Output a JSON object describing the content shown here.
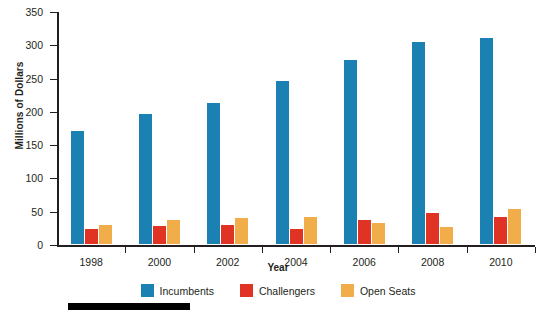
{
  "chart_data": {
    "type": "bar",
    "title": "",
    "xlabel": "Year",
    "ylabel": "Millions of Dollars",
    "categories": [
      "1998",
      "2000",
      "2002",
      "2004",
      "2006",
      "2008",
      "2010"
    ],
    "series": [
      {
        "name": "Incumbents",
        "color": "#1b81b3",
        "values": [
          170,
          195,
          212,
          245,
          277,
          303,
          310
        ]
      },
      {
        "name": "Challengers",
        "color": "#e03323",
        "values": [
          23,
          27,
          29,
          22,
          36,
          47,
          40
        ]
      },
      {
        "name": "Open Seats",
        "color": "#f0ad4a",
        "values": [
          28,
          36,
          39,
          41,
          32,
          26,
          53
        ]
      }
    ],
    "ylim": [
      0,
      350
    ],
    "yticks": [
      0,
      50,
      100,
      150,
      200,
      250,
      300,
      350
    ],
    "ytick_labels": [
      "0",
      "50",
      "100",
      "150",
      "200",
      "250",
      "300",
      "350"
    ],
    "grid": false,
    "legend_position": "bottom"
  },
  "axes": {
    "y_title": "Millions of Dollars",
    "x_title": "Year"
  },
  "legend": {
    "items": [
      {
        "label": "Incumbents",
        "color": "#1b81b3"
      },
      {
        "label": "Challengers",
        "color": "#e03323"
      },
      {
        "label": "Open Seats",
        "color": "#f0ad4a"
      }
    ]
  },
  "colors": {
    "incumbents": "#1b81b3",
    "challengers": "#e03323",
    "open_seats": "#f0ad4a",
    "axis": "#231f20",
    "rule": "#000000",
    "background": "#ffffff"
  }
}
